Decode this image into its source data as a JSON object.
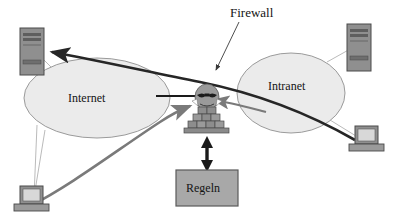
{
  "diagram": {
    "language": "de",
    "labels": {
      "firewall": "Firewall",
      "internet": "Internet",
      "intranet": "Intranet",
      "regeln": "Regeln"
    },
    "nodes": [
      {
        "id": "internet-cloud",
        "label": "Internet",
        "shape": "ellipse",
        "cx": 97,
        "cy": 98,
        "rx": 73,
        "ry": 40
      },
      {
        "id": "intranet-cloud",
        "label": "Intranet",
        "shape": "ellipse",
        "cx": 291,
        "cy": 93,
        "rx": 54,
        "ry": 40
      },
      {
        "id": "firewall-device",
        "label": "Firewall",
        "shape": "brick-wall-with-face",
        "x": 186,
        "y": 84
      },
      {
        "id": "rules-box",
        "label": "Regeln",
        "shape": "rectangle",
        "x": 176,
        "y": 170,
        "w": 62,
        "h": 36
      },
      {
        "id": "server-top-left",
        "label": "",
        "shape": "tower-server",
        "x": 20,
        "y": 28
      },
      {
        "id": "server-top-right",
        "label": "",
        "shape": "tower-server",
        "x": 347,
        "y": 24
      },
      {
        "id": "workstation-bottom-left",
        "label": "",
        "shape": "desktop-workstation",
        "x": 20,
        "y": 186
      },
      {
        "id": "workstation-bottom-right",
        "label": "",
        "shape": "desktop-workstation",
        "x": 355,
        "y": 126
      }
    ],
    "edges": [
      {
        "id": "edge-dark-curve",
        "from": "workstation-bottom-right",
        "to": "server-top-left",
        "style": "thick-curve",
        "color": "#262626",
        "arrow": "end"
      },
      {
        "id": "edge-gray-curve",
        "from": "workstation-bottom-left",
        "to": "firewall-device",
        "style": "thick-curve",
        "color": "#7a7a7a",
        "arrow": "end"
      },
      {
        "id": "edge-gray-intranet",
        "from": "intranet-cloud",
        "to": "firewall-device",
        "style": "straight",
        "color": "#7a7a7a",
        "arrow": "end"
      },
      {
        "id": "edge-internet-firewall",
        "from": "internet-cloud",
        "to": "firewall-device",
        "style": "straight",
        "color": "#1a1a1a",
        "arrow": "none"
      },
      {
        "id": "edge-rules-link",
        "from": "firewall-device",
        "to": "rules-box",
        "style": "double-arrow",
        "color": "#1a1a1a",
        "arrow": "both"
      },
      {
        "id": "leader-firewall-label",
        "from": "firewall-label",
        "to": "firewall-device",
        "style": "leader",
        "color": "#3a3a3a",
        "arrow": "end"
      },
      {
        "id": "link-internet-server",
        "from": "internet-cloud",
        "to": "server-top-left",
        "style": "thin",
        "color": "#a8a8a8",
        "arrow": "none"
      },
      {
        "id": "link-internet-workstation",
        "from": "internet-cloud",
        "to": "workstation-bottom-left",
        "style": "thin",
        "color": "#a8a8a8",
        "arrow": "none"
      },
      {
        "id": "link-intranet-server",
        "from": "intranet-cloud",
        "to": "server-top-right",
        "style": "thin",
        "color": "#a8a8a8",
        "arrow": "none"
      },
      {
        "id": "link-intranet-workstation",
        "from": "intranet-cloud",
        "to": "workstation-bottom-right",
        "style": "thin",
        "color": "#a8a8a8",
        "arrow": "none"
      }
    ],
    "colors": {
      "cloud_fill": "#ebebeb",
      "cloud_stroke": "#8c8c8c",
      "box_fill": "#a8a8a8",
      "box_stroke": "#5a5a5a",
      "device_fill": "#8f8f8f",
      "device_stroke": "#4a4a4a",
      "dark_edge": "#262626",
      "gray_edge": "#7a7a7a",
      "thin_link": "#a8a8a8",
      "text": "#141414",
      "background": "#ffffff"
    }
  }
}
